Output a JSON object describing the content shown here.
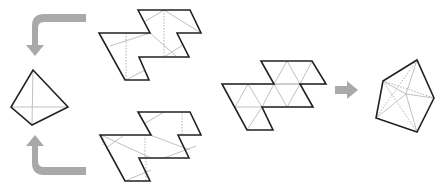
{
  "diagram": {
    "colors": {
      "outline": "#222222",
      "fold_line": "#b9b9b9",
      "arrow": "#a9a9a9",
      "background": "#ffffff"
    },
    "elements": [
      {
        "id": "top-net",
        "label": "",
        "kind": "net",
        "faces": "parallelogram net with inscribed tetrahedron fold lines"
      },
      {
        "id": "bottom-net",
        "label": "",
        "kind": "net",
        "faces": "parallelogram net with inscribed tetrahedron fold lines"
      },
      {
        "id": "tetrahedron",
        "label": "",
        "kind": "solid"
      },
      {
        "id": "middle-net",
        "label": "",
        "kind": "net",
        "faces": "triangular grid net"
      },
      {
        "id": "result-solid",
        "label": "",
        "kind": "solid"
      }
    ],
    "arrows": [
      {
        "from": "top-net",
        "to": "tetrahedron",
        "icon": "curved-arrow-down"
      },
      {
        "from": "bottom-net",
        "to": "tetrahedron",
        "icon": "curved-arrow-up"
      },
      {
        "from": "middle-net",
        "to": "result-solid",
        "icon": "arrow-right"
      }
    ]
  }
}
